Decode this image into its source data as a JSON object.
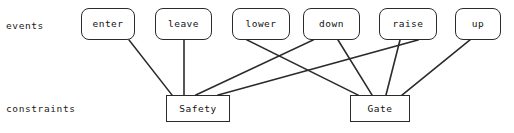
{
  "diagram": {
    "background_color": "#ffffff",
    "stroke_color": "#2b2b2b",
    "text_color": "#111111",
    "row_labels": {
      "events": "events",
      "constraints": "constraints"
    },
    "event_nodes": [
      {
        "id": "enter",
        "label": "enter",
        "x": 81,
        "y": 8,
        "w": 54,
        "h": 32
      },
      {
        "id": "leave",
        "label": "leave",
        "x": 155,
        "y": 8,
        "w": 57,
        "h": 32
      },
      {
        "id": "lower",
        "label": "lower",
        "x": 232,
        "y": 8,
        "w": 58,
        "h": 32
      },
      {
        "id": "down",
        "label": "down",
        "x": 303,
        "y": 8,
        "w": 57,
        "h": 32
      },
      {
        "id": "raise",
        "label": "raise",
        "x": 379,
        "y": 8,
        "w": 58,
        "h": 32
      },
      {
        "id": "up",
        "label": "up",
        "x": 455,
        "y": 8,
        "w": 46,
        "h": 32
      }
    ],
    "constraint_nodes": [
      {
        "id": "safety",
        "label": "Safety",
        "x": 166,
        "y": 95,
        "w": 64,
        "h": 27
      },
      {
        "id": "gate",
        "label": "Gate",
        "x": 350,
        "y": 95,
        "w": 60,
        "h": 27
      }
    ],
    "edges": [
      {
        "from": "enter",
        "to": "safety",
        "x1": 129,
        "y1": 40,
        "x2": 172,
        "y2": 95
      },
      {
        "from": "leave",
        "to": "safety",
        "x1": 184,
        "y1": 40,
        "x2": 184,
        "y2": 95
      },
      {
        "from": "lower",
        "to": "gate",
        "x1": 247,
        "y1": 40,
        "x2": 358,
        "y2": 95
      },
      {
        "from": "down",
        "to": "safety",
        "x1": 313,
        "y1": 40,
        "x2": 196,
        "y2": 95
      },
      {
        "from": "down",
        "to": "gate",
        "x1": 338,
        "y1": 40,
        "x2": 372,
        "y2": 95
      },
      {
        "from": "raise",
        "to": "gate",
        "x1": 400,
        "y1": 40,
        "x2": 386,
        "y2": 95
      },
      {
        "from": "raise",
        "to": "safety",
        "x1": 418,
        "y1": 40,
        "x2": 218,
        "y2": 95
      },
      {
        "from": "up",
        "to": "gate",
        "x1": 470,
        "y1": 40,
        "x2": 402,
        "y2": 95
      }
    ]
  }
}
